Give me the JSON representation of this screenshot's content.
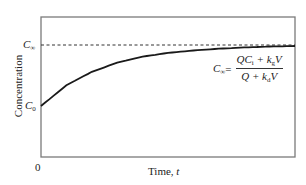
{
  "chart_data": {
    "type": "line",
    "title": "",
    "xlabel": "Time, t",
    "ylabel": "Concentration",
    "x_ticks": [
      "0"
    ],
    "y_ticks": [
      "C0",
      "C∞"
    ],
    "grid": false,
    "legend": null,
    "series": [
      {
        "name": "Concentration C(t)",
        "style": "solid",
        "description": "Exponential rise from C0 approaching C∞",
        "x": [
          0,
          0.1,
          0.2,
          0.3,
          0.4,
          0.5,
          0.6,
          0.7,
          0.8,
          0.9,
          1.0
        ],
        "y_relative": [
          0.0,
          0.34,
          0.56,
          0.71,
          0.81,
          0.87,
          0.91,
          0.94,
          0.96,
          0.975,
          0.983
        ]
      },
      {
        "name": "Steady-state C∞",
        "style": "dashed",
        "y_relative": 1.0
      }
    ],
    "annotations": [
      {
        "text": "C∞ = (QCi + kgV) / (Q + kdV)",
        "position": "right, below asymptote"
      }
    ],
    "xlim": [
      0,
      1
    ],
    "ylim_description": "0 at bottom; C0 ≈ 37% of height; C∞ ≈ 80% of height"
  },
  "labels": {
    "y_axis": "Concentration",
    "x_axis_main": "Time, ",
    "x_axis_var": "t",
    "origin": "0",
    "c_inf_main": "C",
    "c_inf_sub": "∞",
    "c0_main": "C",
    "c0_sub": "0"
  },
  "formula": {
    "lhs_main": "C",
    "lhs_sub": "∞",
    "equals": " =",
    "num_a": "QC",
    "num_a_sub": "i",
    "num_b": " + k",
    "num_b_sub": "g",
    "num_c": "V",
    "den_a": "Q + k",
    "den_a_sub": "d",
    "den_b": "V"
  },
  "colors": {
    "axis": "#7a7a7a",
    "curve": "#1a1a1a",
    "dashed": "#333333"
  }
}
